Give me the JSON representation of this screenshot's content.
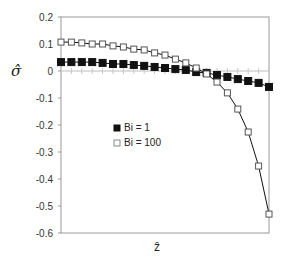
{
  "chart_data": {
    "type": "line",
    "title": "",
    "xlabel": "ẑ",
    "ylabel": "σ̂",
    "ylim": [
      -0.6,
      0.2
    ],
    "yticks": [
      0.2,
      0.1,
      0,
      -0.1,
      -0.2,
      -0.3,
      -0.4,
      -0.5,
      -0.6
    ],
    "ytick_labels": [
      "0.2",
      "0.1",
      "0",
      "-0.1",
      "-0.2",
      "-0.3",
      "-0.4",
      "-0.5",
      "-0.6"
    ],
    "x": [
      0,
      0.05,
      0.1,
      0.15,
      0.2,
      0.25,
      0.3,
      0.35,
      0.4,
      0.45,
      0.5,
      0.55,
      0.6,
      0.65,
      0.7,
      0.75,
      0.8,
      0.85,
      0.9,
      0.95,
      1.0
    ],
    "xlim": [
      0,
      1
    ],
    "xticks_shown": false,
    "grid": false,
    "legend_position": "inside-center-left",
    "series": [
      {
        "name": "Bi = 1",
        "marker": "filled-square",
        "color": "#111111",
        "values": [
          0.033,
          0.033,
          0.033,
          0.033,
          0.03,
          0.026,
          0.026,
          0.022,
          0.019,
          0.015,
          0.011,
          0.007,
          0.004,
          -0.004,
          -0.007,
          -0.015,
          -0.022,
          -0.03,
          -0.037,
          -0.044,
          -0.059
        ]
      },
      {
        "name": "Bi = 100",
        "marker": "open-square",
        "color": "#111111",
        "values": [
          0.107,
          0.107,
          0.104,
          0.1,
          0.1,
          0.093,
          0.089,
          0.081,
          0.078,
          0.067,
          0.059,
          0.044,
          0.03,
          0.011,
          -0.011,
          -0.041,
          -0.081,
          -0.141,
          -0.226,
          -0.352,
          -0.53
        ]
      }
    ]
  },
  "legend": {
    "items": [
      {
        "label": "Bi = 1",
        "marker": "filled-square"
      },
      {
        "label": "Bi = 100",
        "marker": "open-square"
      }
    ]
  },
  "axes": {
    "y_label": "σ̂",
    "x_label": "ẑ"
  }
}
